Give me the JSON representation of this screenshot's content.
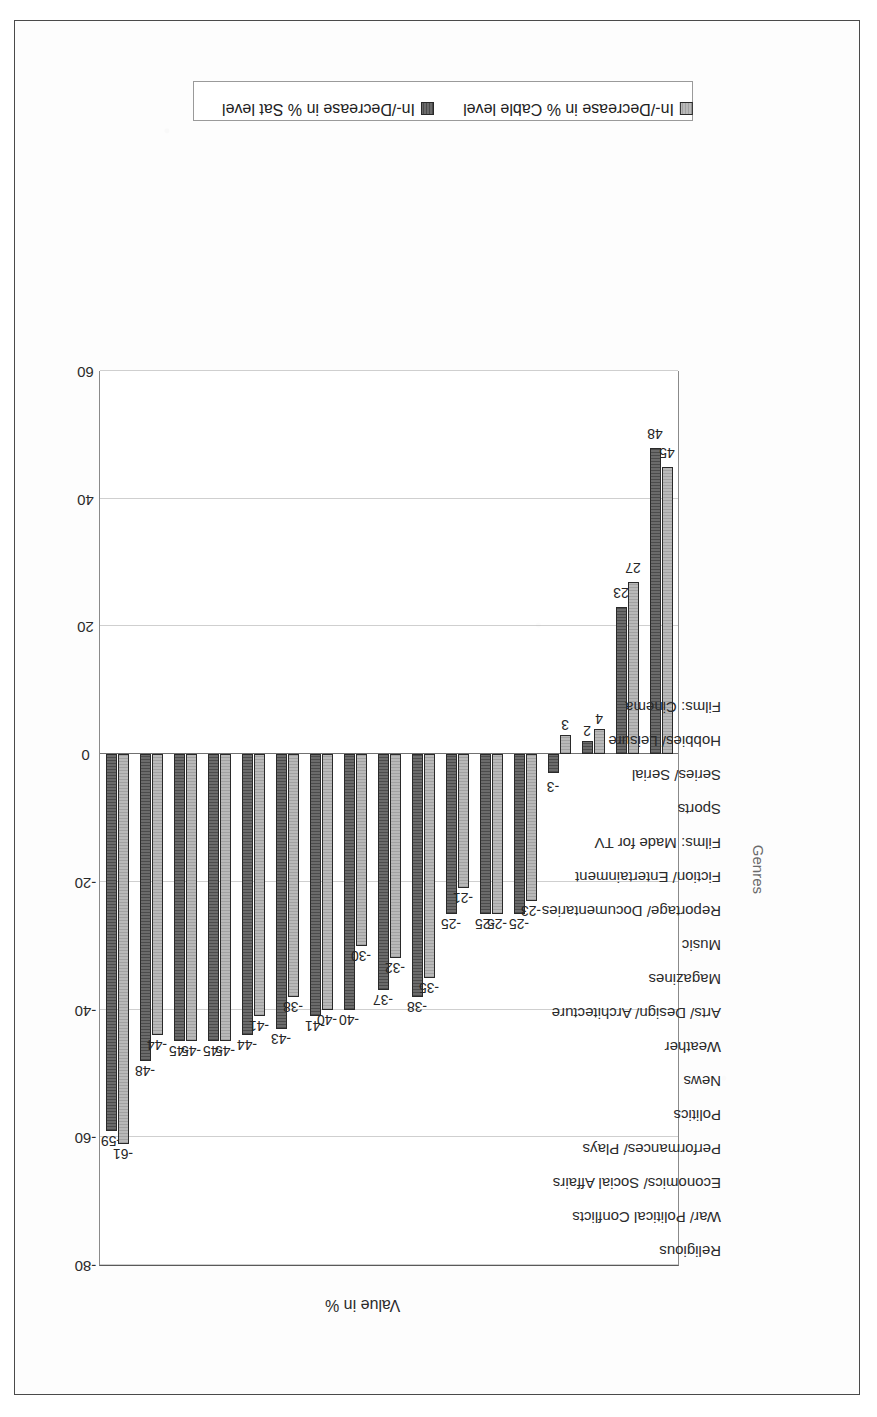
{
  "chart_data": {
    "type": "bar",
    "orientation": "vertical-printed-rotated",
    "title": "",
    "xlabel": "Genres",
    "ylabel": "Value in %",
    "ylim": [
      -80,
      60
    ],
    "ytick_step": 20,
    "yticks": [
      "60",
      "40",
      "20",
      "0",
      "-20",
      "-40",
      "-60",
      "-80"
    ],
    "grid": true,
    "legend_position": "right",
    "categories": [
      "Religious",
      "War/ Political Conflicts",
      "Economics/ Social Affairs",
      "Performances/ Plays",
      "Politics",
      "News",
      "Weather",
      "Arts/ Design/ Architecture",
      "Magazines",
      "Music",
      "Reportage/ Documentaries",
      "Fiction/ Entertainment",
      "Films: Made for TV",
      "Sports",
      "Series/ Serial",
      "Hobbies/ Leisure",
      "Films: Cinema"
    ],
    "series": [
      {
        "name": "In-/Decrease in % Sat level",
        "color": "#6b6b6b",
        "values": [
          -59,
          -48,
          -45,
          -45,
          -44,
          -43,
          -41,
          -40,
          -37,
          -38,
          -25,
          -25,
          -25,
          -3,
          2,
          23,
          48
        ]
      },
      {
        "name": "In-/Decrease in % Cable level",
        "color": "#b9b9b9",
        "values": [
          -61,
          -44,
          -45,
          -45,
          -41,
          -38,
          -40,
          -30,
          -32,
          -35,
          -21,
          -25,
          -23,
          3,
          4,
          27,
          45
        ]
      }
    ]
  },
  "legend": {
    "items": [
      {
        "label": "In-/Decrease in % Sat level",
        "swatch": "sat"
      },
      {
        "label": "In-/Decrease in % Cable level",
        "swatch": "cable"
      }
    ]
  },
  "axis": {
    "value_axis_title": "Value in %",
    "category_axis_title": "Genres"
  }
}
